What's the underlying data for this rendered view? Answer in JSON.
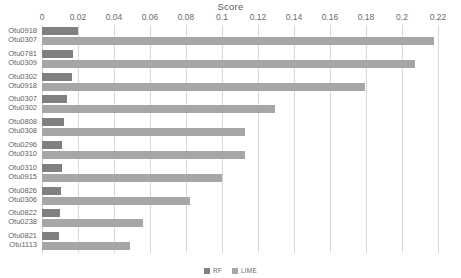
{
  "chart_data": {
    "type": "bar",
    "orientation": "horizontal",
    "title": "Score",
    "xlabel": "",
    "ylabel": "",
    "xlim": [
      0,
      0.22
    ],
    "grid": true,
    "legend_position": "bottom-center",
    "xticks": [
      0,
      0.02,
      0.04,
      0.06,
      0.08,
      0.1,
      0.12,
      0.14,
      0.16,
      0.18,
      0.2,
      0.22
    ],
    "xtick_labels": [
      "0",
      "0.02",
      "0.04",
      "0.06",
      "0.08",
      "0.1",
      "0.12",
      "0.14",
      "0.16",
      "0.18",
      "0.2",
      "0.22"
    ],
    "categories": [
      {
        "rf_label": "Otu0918",
        "lime_label": "Otu0307"
      },
      {
        "rf_label": "Otu0781",
        "lime_label": "Otu0309"
      },
      {
        "rf_label": "Otu0302",
        "lime_label": "Otu0918"
      },
      {
        "rf_label": "Otu0307",
        "lime_label": "Otu0302"
      },
      {
        "rf_label": "Otu0808",
        "lime_label": "Otu0308"
      },
      {
        "rf_label": "Otu0296",
        "lime_label": "Otu0310"
      },
      {
        "rf_label": "Otu0310",
        "lime_label": "Otu0915"
      },
      {
        "rf_label": "Otu0826",
        "lime_label": "Otu0306"
      },
      {
        "rf_label": "Otu0822",
        "lime_label": "Otu0238"
      },
      {
        "rf_label": "Otu0821",
        "lime_label": "Otu1113"
      }
    ],
    "series": [
      {
        "name": "RF",
        "color": "#808080",
        "values": [
          0.02,
          0.0172,
          0.0168,
          0.014,
          0.0122,
          0.0113,
          0.0112,
          0.0105,
          0.0098,
          0.0092
        ]
      },
      {
        "name": "LIME",
        "color": "#a6a6a6",
        "values": [
          0.2178,
          0.2072,
          0.1795,
          0.1295,
          0.1128,
          0.1125,
          0.1,
          0.082,
          0.056,
          0.0489
        ]
      }
    ]
  },
  "legend": {
    "items": [
      {
        "label": "RF",
        "color": "#808080"
      },
      {
        "label": "LIME",
        "color": "#a6a6a6"
      }
    ]
  }
}
